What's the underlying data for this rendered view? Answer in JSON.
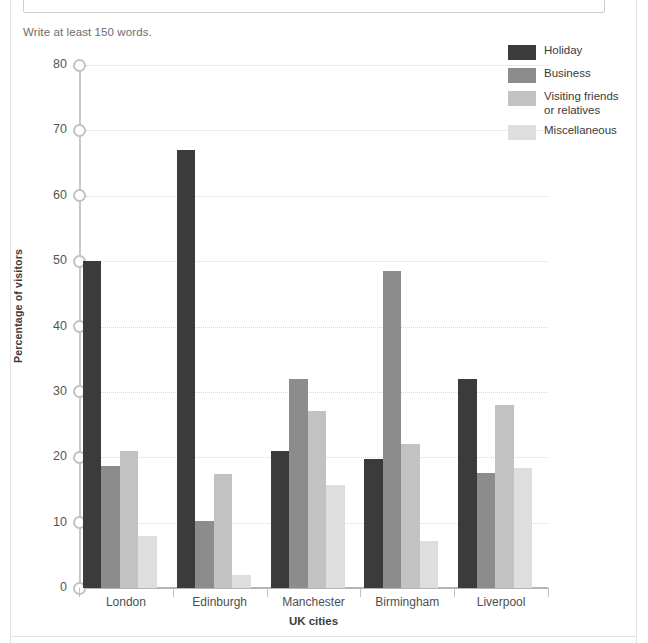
{
  "page": {
    "word_hint": "Write at least 150 words."
  },
  "chart_data": {
    "type": "bar",
    "title": "",
    "xlabel": "UK cities",
    "ylabel": "Percentage of visitors",
    "categories": [
      "London",
      "Edinburgh",
      "Manchester",
      "Birmingham",
      "Liverpool"
    ],
    "ylim": [
      0,
      80
    ],
    "yticks": [
      0,
      10,
      20,
      30,
      40,
      50,
      60,
      70,
      80
    ],
    "ytick_labels": [
      "0",
      "10",
      "20",
      "30",
      "40",
      "50",
      "60",
      "70",
      "80"
    ],
    "grid": true,
    "legend_position": "top-right",
    "series": [
      {
        "name": "Holiday",
        "color": "#3b3b3b",
        "values": [
          50,
          67,
          21,
          19.7,
          32
        ]
      },
      {
        "name": "Business",
        "color": "#8c8c8c",
        "values": [
          18.7,
          10.3,
          32,
          48.5,
          17.6
        ]
      },
      {
        "name": "Visiting friends\nor relatives",
        "color": "#c2c2c2",
        "values": [
          21,
          17.5,
          27,
          22,
          28
        ]
      },
      {
        "name": "Miscellaneous",
        "color": "#dedede",
        "values": [
          8,
          2,
          15.8,
          7.2,
          18.3
        ]
      }
    ]
  }
}
